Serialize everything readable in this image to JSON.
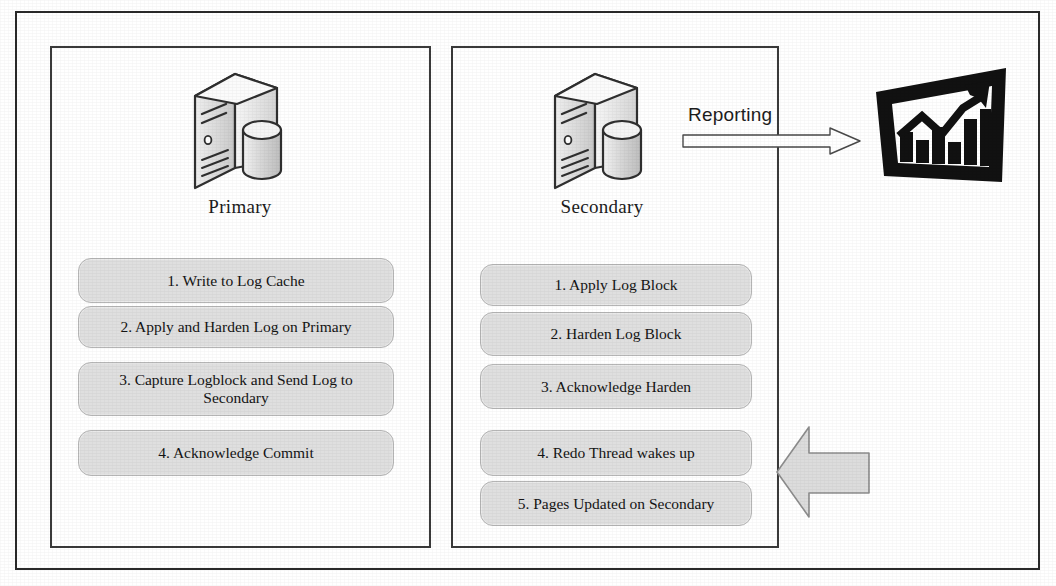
{
  "diagram": {
    "frame": {
      "border_color": "#2a2a2a"
    },
    "nodes": [
      {
        "id": "primary",
        "label": "Primary",
        "icon": "server-database-icon"
      },
      {
        "id": "secondary",
        "label": "Secondary",
        "icon": "server-database-icon"
      }
    ],
    "primary": {
      "label": "Primary",
      "steps": [
        "1. Write to Log Cache",
        "2. Apply and Harden Log on Primary",
        "3. Capture Logblock and Send Log to Secondary",
        "4. Acknowledge Commit"
      ]
    },
    "secondary": {
      "label": "Secondary",
      "steps": [
        "1. Apply Log Block",
        "2. Harden Log Block",
        "3. Acknowledge Harden",
        "4. Redo Thread wakes up",
        "5. Pages Updated on Secondary"
      ]
    },
    "reporting": {
      "label": "Reporting",
      "arrow": "right-arrow-outline-icon",
      "target_icon": "bar-chart-growth-icon"
    },
    "redo_arrow": {
      "icon": "left-block-arrow-icon",
      "fill": "#dcdcdc",
      "stroke": "#8a8a8a"
    },
    "colors": {
      "step_fill": "#dfdfdf",
      "step_border": "#b5b5b5",
      "frame_border": "#2a2a2a",
      "panel_border": "#3a3a3a",
      "chart_icon": "#111111",
      "text": "#141414"
    }
  }
}
